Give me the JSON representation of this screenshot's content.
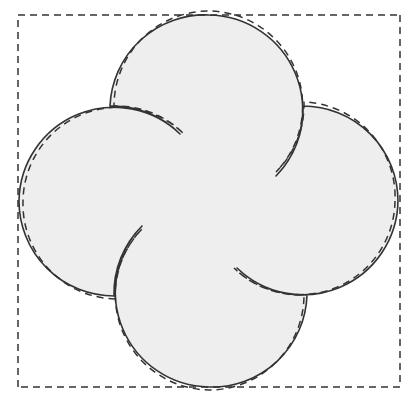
{
  "figure": {
    "title": "Pinwheel dissection of a curved square",
    "caption": "",
    "canvas": {
      "width": 416,
      "height": 404,
      "background": "#ffffff"
    },
    "style": {
      "fill_color": "#eeeeee",
      "solid_stroke_color": "#333333",
      "dashed_stroke_color": "#333333",
      "solid_stroke_width": 1.6,
      "dashed_stroke_width": 1.5,
      "dash_pattern": "7,5"
    },
    "square": {
      "label": "dashed reference square",
      "corners": [
        {
          "name": "top-left",
          "x": 18,
          "y": 15
        },
        {
          "name": "top-right",
          "x": 400,
          "y": 15
        },
        {
          "name": "bottom-right",
          "x": 400,
          "y": 387
        },
        {
          "name": "bottom-left",
          "x": 18,
          "y": 387
        }
      ],
      "side_bulge_radius": 95
    },
    "shape": {
      "label": "solid pinwheel region",
      "center": {
        "x": 209,
        "y": 201
      },
      "lobes": 4,
      "lobe_radius": 95,
      "extents": {
        "left_x": 19,
        "right_x": 398,
        "top_y": 16,
        "bottom_y": 386
      },
      "lobe_centers": [
        {
          "name": "top-lobe",
          "x": 209,
          "y": 108
        },
        {
          "name": "right-lobe",
          "x": 303,
          "y": 201
        },
        {
          "name": "bottom-lobe",
          "x": 209,
          "y": 295
        },
        {
          "name": "left-lobe",
          "x": 114,
          "y": 201
        }
      ]
    },
    "paths": {
      "solid_outline": "M 209 15 A 95 95 0 0 1 276 176 A 95 95 0 0 0 303 106 A 95 95 0 0 1 398 201 A 95 95 0 0 1 237 268 A 95 95 0 0 0 307 295 A 95 95 0 0 1 209 387 A 95 95 0 0 1 142 226 A 95 95 0 0 0 114 296 A 95 95 0 0 1 19 201 A 95 95 0 0 1 180 134 A 95 95 0 0 0 110 106 A 95 95 0 0 1 209 15 Z",
      "dashed_square_sides": [
        "M 18 15 L 400 15",
        "M 400 15 L 400 387",
        "M 400 387 L 18 387",
        "M 18 387 L 18 15"
      ],
      "dashed_arcs": [
        "M 18 15 A 95 95 0 0 1 180 134",
        "M 400 15 A 95 95 0 0 1 276 176",
        "M 400 387 A 95 95 0 0 1 237 268",
        "M 18 387 A 95 95 0 0 1 142 226"
      ]
    }
  }
}
